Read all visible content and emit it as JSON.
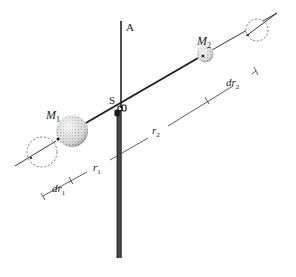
{
  "diagram": {
    "type": "torsion-balance-schematic",
    "labels": {
      "axis": "A",
      "pivot": "S",
      "mass1": "M",
      "mass1_sub": "1",
      "mass2": "M",
      "mass2_sub": "2",
      "r1": "r",
      "r1_sub": "1",
      "r2": "r",
      "r2_sub": "2",
      "dr1": "dr",
      "dr1_sub": "1",
      "dr2": "dr",
      "dr2_sub": "2"
    },
    "colors": {
      "line": "#222222",
      "rod": "#3a3a3a",
      "dashed": "#666666",
      "sphere_fill": "#bdbdbd"
    }
  }
}
